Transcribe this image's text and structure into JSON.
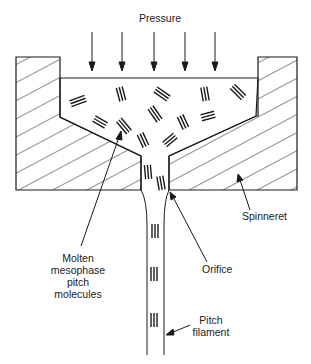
{
  "diagram": {
    "title": "Pressure",
    "labels": {
      "molecules": [
        "Molten",
        "mesophase",
        "pitch",
        "molecules"
      ],
      "orifice": "Orifice",
      "spinneret": "Spinneret",
      "filament": [
        "Pitch",
        "filament"
      ]
    },
    "colors": {
      "stroke": "#1a1a1a",
      "background": "#ffffff",
      "text": "#222222"
    },
    "pressure_arrows": 5
  }
}
